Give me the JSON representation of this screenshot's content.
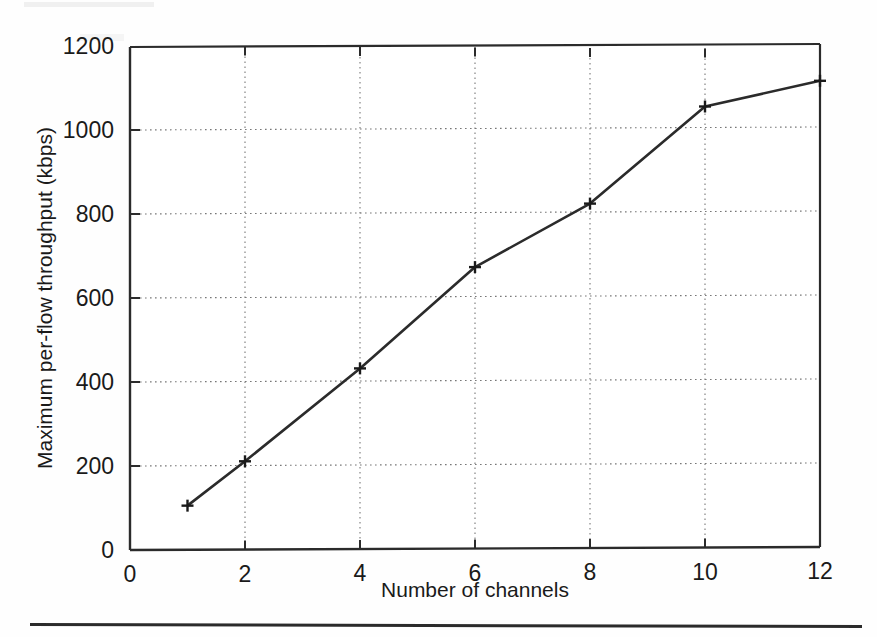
{
  "figure": {
    "kind": "line-plot",
    "line_color": "#2b2b2b",
    "marker": "plus",
    "grid": "dotted"
  },
  "chart_data": {
    "type": "line",
    "title": "",
    "xlabel": "Number of channels",
    "ylabel": "Maximum per-flow throughput (kbps)",
    "xlim": [
      0,
      12
    ],
    "ylim": [
      0,
      1200
    ],
    "grid": true,
    "legend": null,
    "x_ticks": [
      "0",
      "2",
      "4",
      "6",
      "8",
      "10",
      "12"
    ],
    "x_tick_values": [
      0,
      2,
      4,
      6,
      8,
      10,
      12
    ],
    "y_ticks": [
      "0",
      "200",
      "400",
      "600",
      "800",
      "1000",
      "1200"
    ],
    "y_tick_values": [
      0,
      200,
      400,
      600,
      800,
      1000,
      1200
    ],
    "x": [
      1,
      2,
      4,
      6,
      8,
      10,
      12
    ],
    "values": [
      105,
      210,
      430,
      670,
      820,
      1050,
      1110
    ],
    "series": [
      {
        "name": "Maximum per-flow throughput",
        "x": [
          1,
          2,
          4,
          6,
          8,
          10,
          12
        ],
        "values": [
          105,
          210,
          430,
          670,
          820,
          1050,
          1110
        ]
      }
    ]
  }
}
